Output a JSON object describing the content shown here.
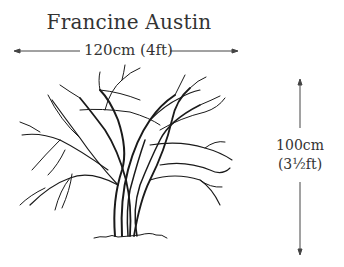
{
  "title": "Francine Austin",
  "dimensions": {
    "width_label": "120cm (4ft)",
    "height_label_line1": "100cm",
    "height_label_line2": "(3½ft)"
  },
  "illustration": {
    "subject": "shrub silhouette with arching branches",
    "stroke_color": "#1a1a1a"
  }
}
